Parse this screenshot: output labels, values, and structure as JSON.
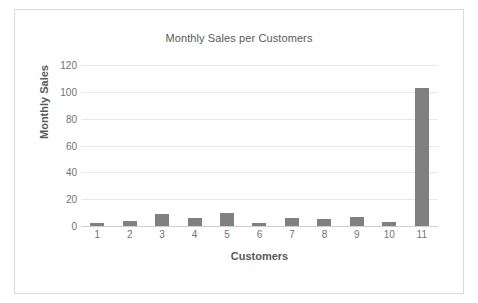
{
  "chart_data": {
    "type": "bar",
    "title": "Monthly Sales per Customers",
    "xlabel": "Customers",
    "ylabel": "Monthly Sales",
    "categories": [
      "1",
      "2",
      "3",
      "4",
      "5",
      "6",
      "7",
      "8",
      "9",
      "10",
      "11"
    ],
    "values": [
      2,
      4,
      9,
      6,
      10,
      2,
      6,
      5,
      7,
      3,
      103
    ],
    "ylim": [
      0,
      120
    ],
    "ytick_labels": [
      "0",
      "20",
      "40",
      "60",
      "80",
      "100",
      "120"
    ],
    "ytick_values": [
      0,
      20,
      40,
      60,
      80,
      100,
      120
    ],
    "grid": true,
    "legend": false,
    "bar_color": "#808080",
    "gridline_color": "#e8e8e8",
    "axis_text_color": "#737373",
    "title_color": "#595959",
    "border_color": "#d9d9d9",
    "background_color": "#ffffff"
  }
}
